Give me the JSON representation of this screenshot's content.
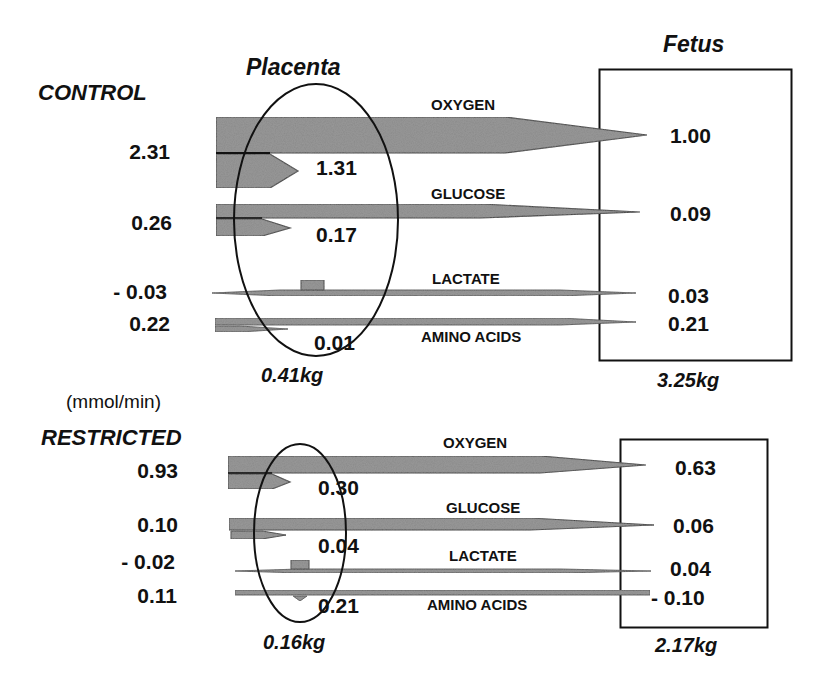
{
  "units": "(mmol/min)",
  "colors": {
    "arrow_fill": "#8a8a8a",
    "arrow_stroke": "#333333",
    "line": "#111111",
    "background": "#ffffff"
  },
  "headers": {
    "placenta": "Placenta",
    "fetus": "Fetus"
  },
  "control": {
    "label": "CONTROL",
    "placenta_weight": "0.41kg",
    "fetus_weight": "3.25kg",
    "rows": [
      {
        "substance": "OXYGEN",
        "uterine_uptake": "2.31",
        "placental_consumption": "1.31",
        "fetal_uptake": "1.00"
      },
      {
        "substance": "GLUCOSE",
        "uterine_uptake": "0.26",
        "placental_consumption": "0.17",
        "fetal_uptake": "0.09"
      },
      {
        "substance": "LACTATE",
        "uterine_uptake": "- 0.03",
        "placental_consumption": "",
        "fetal_uptake": "0.03"
      },
      {
        "substance": "AMINO ACIDS",
        "uterine_uptake": "0.22",
        "placental_consumption": "0.01",
        "fetal_uptake": "0.21"
      }
    ]
  },
  "restricted": {
    "label": "RESTRICTED",
    "placenta_weight": "0.16kg",
    "fetus_weight": "2.17kg",
    "rows": [
      {
        "substance": "OXYGEN",
        "uterine_uptake": "0.93",
        "placental_consumption": "0.30",
        "fetal_uptake": "0.63"
      },
      {
        "substance": "GLUCOSE",
        "uterine_uptake": "0.10",
        "placental_consumption": "0.04",
        "fetal_uptake": "0.06"
      },
      {
        "substance": "LACTATE",
        "uterine_uptake": "- 0.02",
        "placental_consumption": "",
        "fetal_uptake": "0.04"
      },
      {
        "substance": "AMINO ACIDS",
        "uterine_uptake": "0.11",
        "placental_consumption": "0.21",
        "fetal_uptake": "- 0.10"
      }
    ]
  }
}
